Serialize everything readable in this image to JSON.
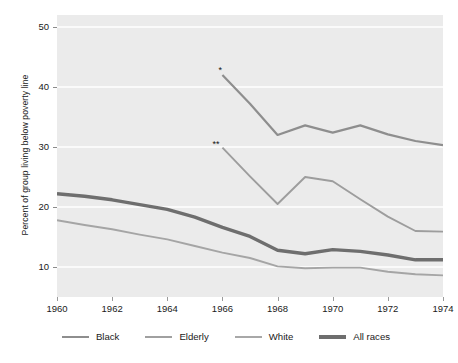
{
  "chart_data": {
    "type": "line",
    "title": "",
    "xlabel": "",
    "ylabel": "Percent of group living below poverty line",
    "xlim": [
      1960,
      1974
    ],
    "ylim": [
      5,
      52
    ],
    "grid": "horizontal white gridlines on light gray plot background",
    "legend_position": "bottom-center",
    "yticks": [
      10,
      20,
      30,
      40,
      50
    ],
    "xticks": [
      1960,
      1962,
      1964,
      1966,
      1968,
      1970,
      1972,
      1974
    ],
    "annotations": [
      {
        "text": "*",
        "series": "Black",
        "x": 1966,
        "y": 42.4
      },
      {
        "text": "**",
        "series": "Elderly",
        "x": 1966,
        "y": 30.0
      }
    ],
    "series": [
      {
        "name": "Black",
        "color": "#8e8e8e",
        "width": 2.2,
        "x": [
          1966,
          1967,
          1968,
          1969,
          1970,
          1971,
          1972,
          1973,
          1974
        ],
        "values": [
          42.0,
          37.2,
          32.0,
          33.6,
          32.4,
          33.6,
          32.1,
          31.0,
          30.3
        ]
      },
      {
        "name": "Elderly",
        "color": "#9d9d9d",
        "width": 1.9,
        "x": [
          1966,
          1967,
          1968,
          1969,
          1970,
          1971,
          1972,
          1973,
          1974
        ],
        "values": [
          29.9,
          25.1,
          20.5,
          25.0,
          24.3,
          21.3,
          18.4,
          16.0,
          15.9
        ]
      },
      {
        "name": "White",
        "color": "#a5a5a5",
        "width": 1.9,
        "x": [
          1960,
          1961,
          1962,
          1963,
          1964,
          1965,
          1966,
          1967,
          1968,
          1969,
          1970,
          1971,
          1972,
          1973,
          1974
        ],
        "values": [
          17.8,
          17.0,
          16.3,
          15.4,
          14.6,
          13.5,
          12.4,
          11.5,
          10.1,
          9.8,
          9.9,
          9.9,
          9.2,
          8.8,
          8.6
        ]
      },
      {
        "name": "All races",
        "color": "#6e6e6e",
        "width": 3.4,
        "x": [
          1960,
          1961,
          1962,
          1963,
          1964,
          1965,
          1966,
          1967,
          1968,
          1969,
          1970,
          1971,
          1972,
          1973,
          1974
        ],
        "values": [
          22.2,
          21.8,
          21.2,
          20.4,
          19.6,
          18.3,
          16.6,
          15.1,
          12.8,
          12.2,
          12.9,
          12.6,
          12.0,
          11.2,
          11.2
        ]
      }
    ]
  },
  "axes": {
    "y_title": "Percent of group living below poverty line",
    "y_tick_labels": [
      "50",
      "40",
      "30",
      "20",
      "10"
    ],
    "x_tick_labels": [
      "1960",
      "1962",
      "1964",
      "1966",
      "1968",
      "1970",
      "1972",
      "1974"
    ]
  },
  "legend": {
    "items": [
      {
        "label": "Black",
        "color": "#8e8e8e",
        "thickness": "2px"
      },
      {
        "label": "Elderly",
        "color": "#a0a0a0",
        "thickness": "2px"
      },
      {
        "label": "White",
        "color": "#a8a8a8",
        "thickness": "2px"
      },
      {
        "label": "All races",
        "color": "#6e6e6e",
        "thickness": "4px"
      }
    ]
  },
  "colors": {
    "plot_background": "#ebebeb",
    "page_background": "#ffffff",
    "gridline": "#ffffff",
    "text": "#1a1a1a"
  }
}
